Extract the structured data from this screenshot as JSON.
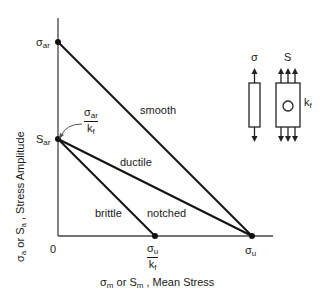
{
  "diagram": {
    "axes": {
      "y_label": {
        "sym1": "σ",
        "sub1": "a",
        "or": " or ",
        "sym2": "S",
        "sub2": "a",
        "rest": " , Stress Amplitude"
      },
      "x_label": {
        "sym1": "σ",
        "sub1": "m",
        "or": " or ",
        "sym2": "S",
        "sub2": "m",
        "rest": " , Mean Stress"
      },
      "origin": "0"
    },
    "points": {
      "sigma_ar": {
        "sym": "σ",
        "sub": "ar"
      },
      "S_ar": {
        "sym": "S",
        "sub": "ar"
      },
      "sigma_u": {
        "sym": "σ",
        "sub": "u"
      },
      "sigma_u_over_kf": {
        "num_sym": "σ",
        "num_sub": "u",
        "den_sym": "k",
        "den_sub": "f"
      },
      "sigma_ar_over_kf": {
        "num_sym": "σ",
        "num_sub": "ar",
        "den_sym": "k",
        "den_sub": "f"
      }
    },
    "lines": {
      "smooth": "smooth",
      "ductile": "ductile",
      "notched": "notched",
      "brittle": "brittle"
    },
    "specimens": {
      "smooth_label": "σ",
      "notched_label": "S",
      "kf": {
        "sym": "k",
        "sub": "f"
      }
    }
  }
}
